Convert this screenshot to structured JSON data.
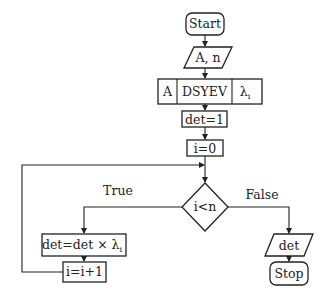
{
  "diagram": {
    "type": "flowchart",
    "nodes": {
      "start": {
        "label": "Start",
        "shape": "terminal"
      },
      "input": {
        "label": "A, n",
        "shape": "io"
      },
      "dsyev": {
        "label_left": "A",
        "label_mid": "DSYEV",
        "label_right_base": "λ",
        "label_right_sub": "i",
        "shape": "predefined-process"
      },
      "det_init": {
        "label": "det=1",
        "shape": "process"
      },
      "i_init": {
        "label": "i=0",
        "shape": "process"
      },
      "cond": {
        "label": "i<n",
        "shape": "decision"
      },
      "det_update": {
        "label_base": "det=det × λ",
        "label_sub": "i",
        "shape": "process"
      },
      "i_inc": {
        "label": "i=i+1",
        "shape": "process"
      },
      "output": {
        "label": "det",
        "shape": "io"
      },
      "stop": {
        "label": "Stop",
        "shape": "terminal"
      }
    },
    "edges": {
      "true_label": "True",
      "false_label": "False"
    },
    "colors": {
      "stroke": "#222222",
      "background": "#ffffff"
    }
  }
}
